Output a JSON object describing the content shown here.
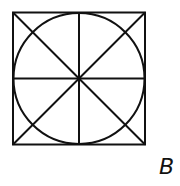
{
  "figure": {
    "label": "B",
    "stroke_color": "#111111"
  }
}
